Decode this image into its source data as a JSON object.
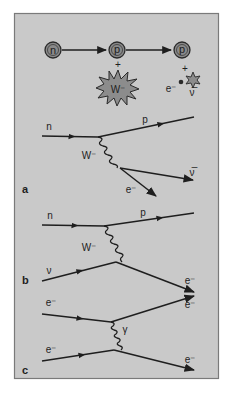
{
  "figure": {
    "panel": {
      "background": "#c9c9c9",
      "border": "#7a7a7a",
      "line_color": "#1e1e1e",
      "circle_fill": "#8a8a8a",
      "burst_fill": "#8c8c8c"
    },
    "top_row": {
      "particles": [
        {
          "id": "neutron",
          "label": "n"
        },
        {
          "id": "proton-1",
          "label": "p"
        },
        {
          "id": "proton-2",
          "label": "p"
        }
      ],
      "plus_1": "+",
      "boson": "W⁻",
      "plus_2": "+",
      "electron": "e⁻",
      "antineutrino": "ν̅"
    },
    "diagram_a": {
      "panel_label": "a",
      "incoming": "n",
      "outgoing_proton": "p",
      "boson": "W⁻",
      "electron": "e⁻",
      "antineutrino": "ν̅"
    },
    "diagram_b": {
      "panel_label": "b",
      "incoming_neutron": "n",
      "outgoing_proton": "p",
      "boson": "W⁻",
      "incoming_neutrino": "ν",
      "outgoing_electron": "e⁻"
    },
    "diagram_c": {
      "panel_label": "c",
      "incoming_electron_1": "e⁻",
      "outgoing_electron_1": "e⁻",
      "boson": "γ",
      "incoming_electron_2": "e⁻",
      "outgoing_electron_2": "e⁻"
    }
  }
}
